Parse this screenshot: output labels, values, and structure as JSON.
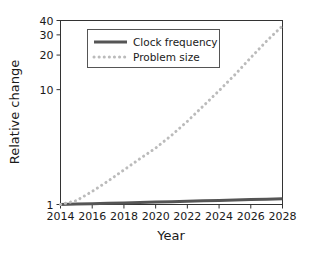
{
  "chart_data": {
    "type": "line",
    "title": "",
    "xlabel": "Year",
    "ylabel": "Relative change",
    "xlim": [
      2014,
      2028
    ],
    "ylim": [
      1,
      40
    ],
    "yscale": "log",
    "grid": false,
    "legend_position": "upper center",
    "xticks": [
      2014,
      2016,
      2018,
      2020,
      2022,
      2024,
      2026,
      2028
    ],
    "xticklabels": [
      "2014",
      "2016",
      "2018",
      "2020",
      "2022",
      "2024",
      "2026",
      "2028"
    ],
    "yticks": [
      1,
      10,
      20,
      30,
      40
    ],
    "yticklabels": [
      "1",
      "10",
      "20",
      "30",
      "40"
    ],
    "x": [
      2014,
      2015,
      2016,
      2017,
      2018,
      2019,
      2020,
      2021,
      2022,
      2023,
      2024,
      2025,
      2026,
      2027,
      2028
    ],
    "series": [
      {
        "name": "Clock frequency",
        "style": "solid",
        "color": "#555555",
        "values": [
          1.0,
          1.008,
          1.016,
          1.025,
          1.033,
          1.042,
          1.05,
          1.059,
          1.068,
          1.077,
          1.086,
          1.095,
          1.104,
          1.113,
          1.12
        ]
      },
      {
        "name": "Problem size",
        "style": "dotted",
        "color": "#bbbbbb",
        "values": [
          1.0,
          1.08,
          1.3,
          1.6,
          2.0,
          2.5,
          3.1,
          4.0,
          5.3,
          7.2,
          9.8,
          13.5,
          19.0,
          26.5,
          36.0
        ]
      }
    ]
  },
  "legend": {
    "items": [
      {
        "label": "Clock frequency",
        "style": "solid",
        "color": "#555555"
      },
      {
        "label": "Problem size",
        "style": "dotted",
        "color": "#bbbbbb"
      }
    ]
  },
  "axes": {
    "x_title": "Year",
    "y_title": "Relative change"
  }
}
